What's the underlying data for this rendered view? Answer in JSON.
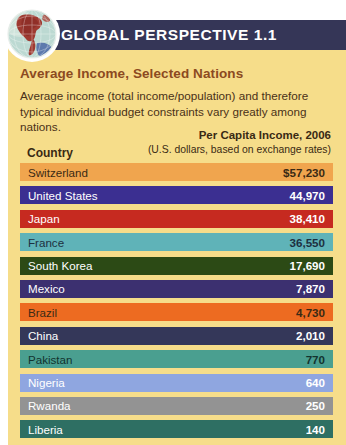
{
  "banner": {
    "title": "GLOBAL PERSPECTIVE 1.1",
    "icon": "globe-icon",
    "bg_color": "#353657"
  },
  "card": {
    "bg_color": "#f6dd8a",
    "subtitle": "Average Income, Selected Nations",
    "subtitle_color": "#8c4a21",
    "description": "Average income (total income/population) and therefore typical individual budget constraints vary greatly among nations."
  },
  "table": {
    "col_country": "Country",
    "col_income_line1": "Per Capita Income, 2006",
    "col_income_line2": "(U.S. dollars, based on exchange rates)"
  },
  "chart_data": {
    "type": "bar",
    "title": "Average Income, Selected Nations",
    "subtitle": "Average income (total income/population) and therefore typical individual budget constraints vary greatly among nations.",
    "xlabel": "Per Capita Income, 2006 (U.S. dollars, based on exchange rates)",
    "ylabel": "Country",
    "orientation": "horizontal",
    "grid": false,
    "legend": false,
    "categories": [
      "Switzerland",
      "United States",
      "Japan",
      "France",
      "South Korea",
      "Mexico",
      "Brazil",
      "China",
      "Pakistan",
      "Nigeria",
      "Rwanda",
      "Liberia"
    ],
    "values": [
      57230,
      44970,
      38410,
      36550,
      17690,
      7870,
      4730,
      2010,
      770,
      640,
      250,
      140
    ],
    "value_labels": [
      "$57,230",
      "44,970",
      "38,410",
      "36,550",
      "17,690",
      "7,870",
      "4,730",
      "2,010",
      "770",
      "640",
      "250",
      "140"
    ],
    "bar_colors": [
      "#f0a54e",
      "#3b2f91",
      "#c62a20",
      "#5fb3b8",
      "#2c4a15",
      "#3c3070",
      "#ed6b21",
      "#343759",
      "#4a9f90",
      "#8fa6e0",
      "#939393",
      "#2e6f63"
    ],
    "label_colors": [
      "#3a2a14",
      "#ffffff",
      "#ffffff",
      "#1d3040",
      "#ffffff",
      "#ffffff",
      "#3a2a14",
      "#ffffff",
      "#12332f",
      "#ffffff",
      "#ffffff",
      "#ffffff"
    ]
  }
}
